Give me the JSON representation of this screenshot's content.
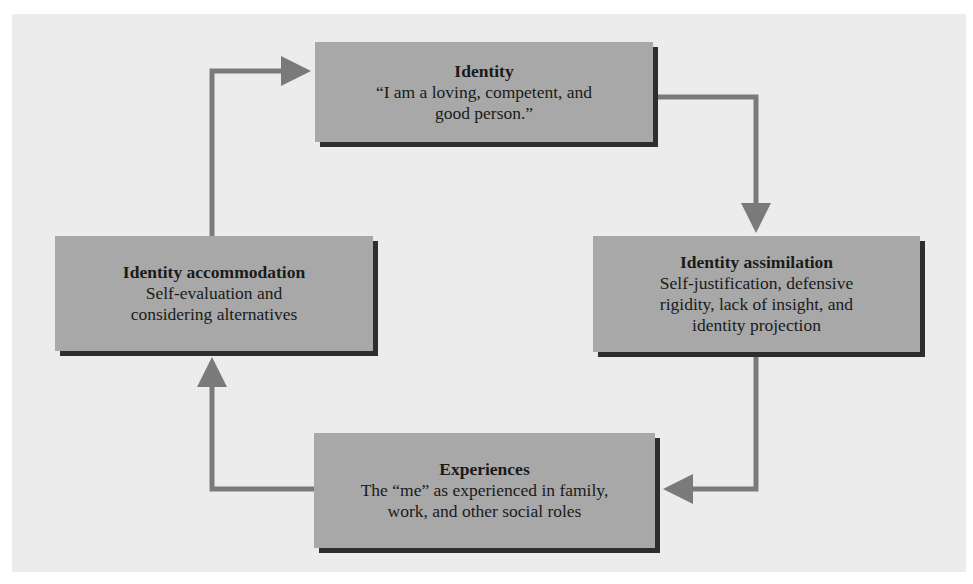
{
  "diagram": {
    "colors": {
      "background": "#ececec",
      "box_fill": "#a8a8a8",
      "box_shadow": "#2e2e2e",
      "arrow": "#7a7a7a",
      "text": "#1a1a1a"
    },
    "nodes": {
      "identity": {
        "title": "Identity",
        "desc": "“I am a loving, competent, and\ngood person.”"
      },
      "assimilation": {
        "title": "Identity assimilation",
        "desc": "Self-justification, defensive\nrigidity, lack of insight, and\nidentity projection"
      },
      "experiences": {
        "title": "Experiences",
        "desc": "The “me” as experienced in family,\nwork, and other social roles"
      },
      "accommodation": {
        "title": "Identity accommodation",
        "desc": "Self-evaluation and\nconsidering alternatives"
      }
    },
    "edges": [
      {
        "from": "identity",
        "to": "assimilation",
        "icon": "arrow-right-down-icon"
      },
      {
        "from": "assimilation",
        "to": "experiences",
        "icon": "arrow-down-left-icon"
      },
      {
        "from": "experiences",
        "to": "accommodation",
        "icon": "arrow-left-up-icon"
      },
      {
        "from": "accommodation",
        "to": "identity",
        "icon": "arrow-up-right-icon"
      }
    ]
  }
}
